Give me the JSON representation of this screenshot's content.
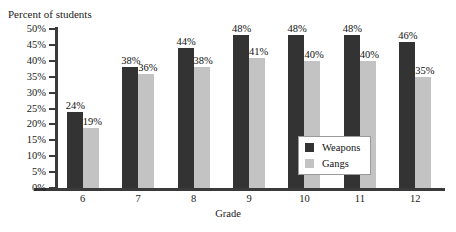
{
  "chart_data": {
    "type": "bar",
    "title": "",
    "ylabel": "Percent of students",
    "xlabel": "Grade",
    "categories": [
      "6",
      "7",
      "8",
      "9",
      "10",
      "11",
      "12"
    ],
    "series": [
      {
        "name": "Weapons",
        "color": "#333333",
        "values": [
          24,
          38,
          44,
          48,
          48,
          48,
          46
        ],
        "labels": [
          "24%",
          "38%",
          "44%",
          "48%",
          "48%",
          "48%",
          "46%"
        ]
      },
      {
        "name": "Gangs",
        "color": "#c3c3c3",
        "values": [
          19,
          36,
          38,
          41,
          40,
          40,
          35
        ],
        "labels": [
          "19%",
          "36%",
          "38%",
          "41%",
          "40%",
          "40%",
          "35%"
        ]
      }
    ],
    "ylim": [
      0,
      50
    ],
    "ytick_values": [
      0,
      5,
      10,
      15,
      20,
      25,
      30,
      35,
      40,
      45,
      50
    ],
    "ytick_labels": [
      "0%",
      "5%",
      "10%",
      "15%",
      "20%",
      "25%",
      "30%",
      "35%",
      "40%",
      "45%",
      "50%"
    ],
    "grid": false,
    "legend_position": "inside-right"
  }
}
